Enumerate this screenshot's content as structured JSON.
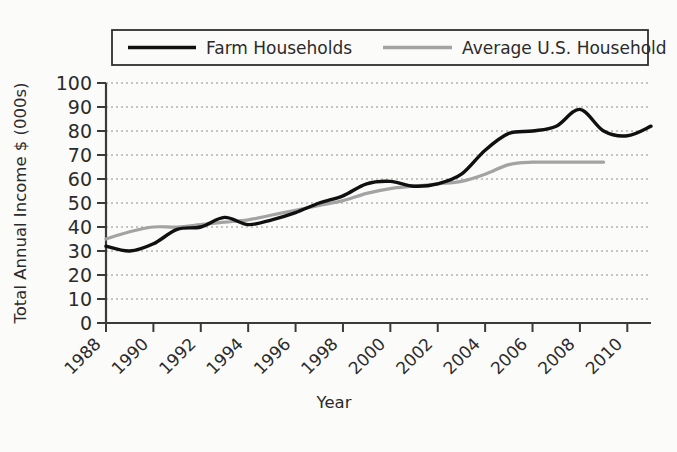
{
  "chart_data": {
    "type": "line",
    "title": "",
    "xlabel": "Year",
    "ylabel": "Total Annual Income $ (000s)",
    "xlim": [
      1988,
      2011
    ],
    "ylim": [
      0,
      100
    ],
    "y_ticks": [
      0,
      10,
      20,
      30,
      40,
      50,
      60,
      70,
      80,
      90,
      100
    ],
    "x_ticks": [
      1988,
      1990,
      1992,
      1994,
      1996,
      1998,
      2000,
      2002,
      2004,
      2006,
      2008,
      2010
    ],
    "grid": true,
    "legend_position": "top",
    "series": [
      {
        "name": "Farm Households",
        "color": "#101010",
        "x": [
          1988,
          1989,
          1990,
          1991,
          1992,
          1993,
          1994,
          1995,
          1996,
          1997,
          1998,
          1999,
          2000,
          2001,
          2002,
          2003,
          2004,
          2005,
          2006,
          2007,
          2008,
          2009,
          2010,
          2011
        ],
        "values": [
          32,
          30,
          33,
          39,
          40,
          44,
          41,
          43,
          46,
          50,
          53,
          58,
          59,
          57,
          58,
          62,
          72,
          79,
          80,
          82,
          89,
          80,
          78,
          82
        ]
      },
      {
        "name": "Average U.S. Household",
        "color": "#a3a3a3",
        "x": [
          1988,
          1989,
          1990,
          1991,
          1992,
          1993,
          1994,
          1995,
          1996,
          1997,
          1998,
          1999,
          2000,
          2001,
          2002,
          2003,
          2004,
          2005,
          2006,
          2007,
          2008,
          2009
        ],
        "values": [
          35,
          38,
          40,
          40,
          41,
          42,
          43,
          45,
          47,
          49,
          51,
          54,
          56,
          57,
          58,
          59,
          62,
          66,
          67,
          67,
          67,
          67
        ]
      }
    ],
    "legend": [
      {
        "label": "Farm Households",
        "swatch_color": "#101010"
      },
      {
        "label": "Average U.S. Household",
        "swatch_color": "#a3a3a3"
      }
    ]
  },
  "colors": {
    "background": "#fbfbfa",
    "axis": "#3a3a3a",
    "grid": "#8d8d8d",
    "farm_line": "#101010",
    "average_line": "#a3a3a3",
    "text": "#2b2b2b"
  }
}
